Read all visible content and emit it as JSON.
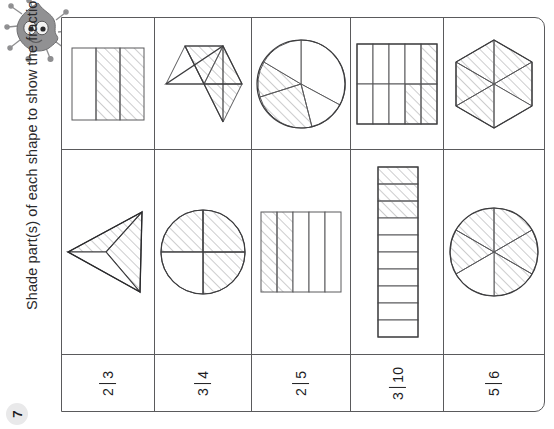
{
  "worksheet": {
    "question_number": "7",
    "instruction": "Shade part(s) of each shape to show the fraction given.",
    "mascot_name": "monster-mascot",
    "colors": {
      "line": "#5a5a5c",
      "hatch": "#9b9b9d",
      "text": "#1d1d1f",
      "badge_bg": "#e9e9ea",
      "mascot_body": "#8e8e90"
    }
  },
  "columns": [
    {
      "id": "col-1",
      "fraction": {
        "numerator": "2",
        "denominator": "3",
        "text": "2/3"
      },
      "top_shape": {
        "name": "rectangle-thirds",
        "type": "rectangle",
        "parts": 3,
        "shaded": 2
      },
      "bottom_shape": {
        "name": "triangle-thirds",
        "type": "triangle",
        "parts": 3,
        "shaded": 2
      }
    },
    {
      "id": "col-2",
      "fraction": {
        "numerator": "3",
        "denominator": "4",
        "text": "3/4"
      },
      "top_shape": {
        "name": "triangle-quarters",
        "type": "triangle",
        "parts": 4,
        "shaded": 3
      },
      "bottom_shape": {
        "name": "circle-quarters",
        "type": "circle",
        "parts": 4,
        "shaded": 3
      }
    },
    {
      "id": "col-3",
      "fraction": {
        "numerator": "2",
        "denominator": "5",
        "text": "2/5"
      },
      "top_shape": {
        "name": "circle-fifths",
        "type": "circle",
        "parts": 5,
        "shaded": 2
      },
      "bottom_shape": {
        "name": "rectangle-fifths",
        "type": "rectangle",
        "parts": 5,
        "shaded": 2
      }
    },
    {
      "id": "col-4",
      "fraction": {
        "numerator": "3",
        "denominator": "10",
        "text": "3/10"
      },
      "top_shape": {
        "name": "grid-tenths",
        "type": "grid",
        "parts": 10,
        "shaded": 3
      },
      "bottom_shape": {
        "name": "bar-tenths",
        "type": "bar",
        "parts": 10,
        "shaded": 3
      }
    },
    {
      "id": "col-5",
      "fraction": {
        "numerator": "5",
        "denominator": "6",
        "text": "5/6"
      },
      "top_shape": {
        "name": "hexagon-sixths",
        "type": "hexagon",
        "parts": 6,
        "shaded": 5
      },
      "bottom_shape": {
        "name": "circle-sixths",
        "type": "circle",
        "parts": 6,
        "shaded": 5
      }
    }
  ]
}
